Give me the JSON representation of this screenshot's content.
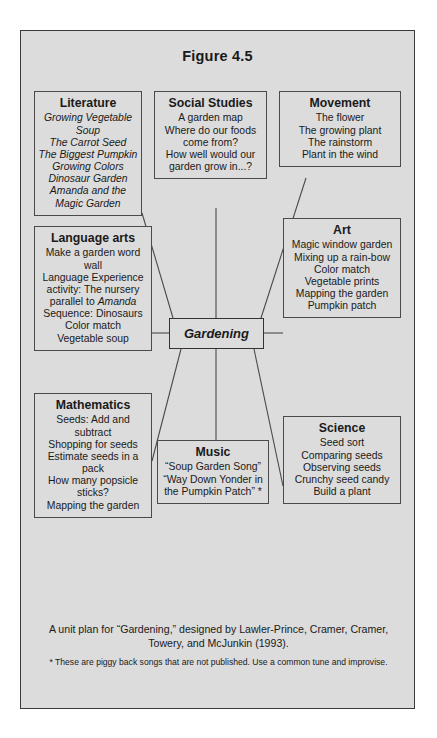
{
  "figure": {
    "title": "Figure 4.5",
    "hub_label": "Gardening"
  },
  "nodes": {
    "literature": {
      "title": "Literature",
      "items": [
        "Growing Vegetable Soup",
        "The Carrot Seed",
        "The Biggest Pumpkin",
        "Growing Colors",
        "Dinosaur Garden",
        "Amanda and the Magic Garden"
      ]
    },
    "social_studies": {
      "title": "Social Studies",
      "items": [
        "A garden map",
        "Where do our foods come from?",
        "How well would our garden grow in...?"
      ]
    },
    "movement": {
      "title": "Movement",
      "items": [
        "The flower",
        "The growing plant",
        "The rainstorm",
        "Plant in the wind"
      ]
    },
    "language_arts": {
      "title": "Language arts",
      "items": [
        "Make a garden word wall",
        "Language Experience activity: The nursery parallel to Amanda",
        "Sequence: Dinosaurs",
        "Color match",
        "Vegetable soup"
      ],
      "italic_word": "Amanda"
    },
    "art": {
      "title": "Art",
      "items": [
        "Magic window garden",
        "Mixing up a rain-bow",
        "Color match",
        "Vegetable prints",
        "Mapping the garden",
        "Pumpkin patch"
      ]
    },
    "mathematics": {
      "title": "Mathematics",
      "items": [
        "Seeds: Add and subtract",
        "Shopping for seeds",
        "Estimate seeds in a pack",
        "How many popsicle sticks?",
        "Mapping the garden"
      ]
    },
    "music": {
      "title": "Music",
      "items": [
        "“Soup Garden Song”",
        "“Way Down Yonder in the Pumpkin Patch” *"
      ]
    },
    "science": {
      "title": "Science",
      "items": [
        "Seed sort",
        "Comparing seeds",
        "Observing seeds",
        "Crunchy seed candy",
        "Build a plant"
      ]
    }
  },
  "footer": {
    "credit": "A unit plan for “Gardening,” designed by Lawler-Prince, Cramer, Cramer, Towery, and McJunkin (1993).",
    "note": "* These are piggy back songs that are not published. Use a common tune and improvise."
  },
  "colors": {
    "background": "#dcdcdc",
    "border": "#4a4a4a",
    "text": "#1a1a1a",
    "page": "#ffffff"
  },
  "chart_data": {
    "type": "diagram",
    "layout": "web / spider cluster map",
    "center": "Gardening",
    "branches": [
      "Literature",
      "Social Studies",
      "Movement",
      "Language arts",
      "Art",
      "Mathematics",
      "Music",
      "Science"
    ]
  }
}
